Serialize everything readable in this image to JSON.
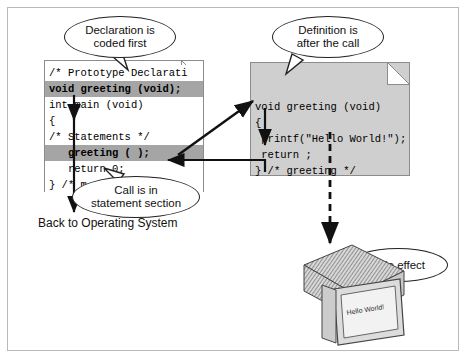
{
  "left_page": {
    "name": "main-function-code-page",
    "lines": [
      {
        "text": "/* Prototype Declarati",
        "style": "plain"
      },
      {
        "text": "void greeting (void);",
        "style": "highlight"
      },
      {
        "text": "int main (void)",
        "style": "plain"
      },
      {
        "text": "{",
        "style": "plain"
      },
      {
        "text": "/* Statements */",
        "style": "plain"
      },
      {
        "text": "   greeting ( );",
        "style": "highlight"
      },
      {
        "text": "   return 0;",
        "style": "plain"
      },
      {
        "text": "} /* m",
        "style": "plain"
      }
    ]
  },
  "right_page": {
    "name": "greeting-function-code-page",
    "lines": [
      {
        "text": "void greeting (void)",
        "style": "plain"
      },
      {
        "text": "{",
        "style": "plain"
      },
      {
        "text": " printf(\"Hello World!\");",
        "style": "plain"
      },
      {
        "text": " return ;",
        "style": "plain"
      },
      {
        "text": "} /* greeting */",
        "style": "plain"
      }
    ]
  },
  "bubbles": {
    "declaration": {
      "line1": "Declaration is",
      "line2": "coded first"
    },
    "definition": {
      "line1": "Definition is",
      "line2": "after the call"
    },
    "call": {
      "line1": "Call is in",
      "line2": "statement section"
    },
    "side_effect": {
      "line1": "Side effect",
      "line2": ""
    }
  },
  "captions": {
    "back_to_os": "Back to Operating System"
  },
  "monitor": {
    "screen_text": "Hello World!"
  },
  "colors": {
    "page_fill_white": "#ffffff",
    "page_fill_gray": "#cfcfcf",
    "highlight": "#a5a5a5",
    "outline": "#8c8c8c",
    "arrow": "#111111",
    "frame_border": "#b9b9b9"
  }
}
